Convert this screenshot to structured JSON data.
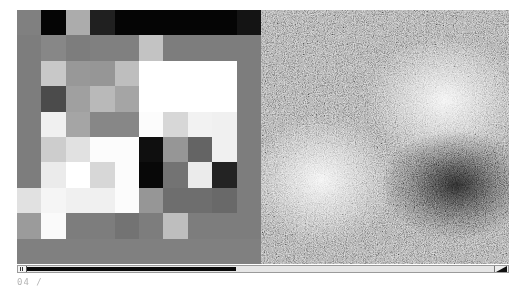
{
  "left_panel": {
    "rows": 10,
    "cols": 10,
    "cells": [
      [
        128,
        5,
        172,
        32,
        5,
        5,
        5,
        5,
        5,
        20
      ],
      [
        125,
        135,
        125,
        128,
        128,
        195,
        125,
        125,
        125,
        125
      ],
      [
        125,
        200,
        152,
        150,
        190,
        255,
        255,
        255,
        255,
        125
      ],
      [
        125,
        75,
        160,
        185,
        165,
        255,
        255,
        255,
        255,
        125
      ],
      [
        125,
        240,
        165,
        135,
        135,
        252,
        215,
        242,
        240,
        125
      ],
      [
        125,
        205,
        225,
        252,
        252,
        15,
        150,
        100,
        240,
        125
      ],
      [
        125,
        235,
        255,
        215,
        252,
        8,
        115,
        235,
        35,
        125
      ],
      [
        225,
        245,
        240,
        240,
        252,
        150,
        110,
        110,
        105,
        125
      ],
      [
        155,
        250,
        125,
        125,
        115,
        125,
        190,
        125,
        125,
        125
      ],
      [
        128,
        128,
        128,
        128,
        128,
        128,
        128,
        128,
        128,
        128
      ]
    ]
  },
  "right_panel": {
    "blobs": [
      {
        "cx": 184,
        "cy": 90,
        "r": 80,
        "tone": "bright"
      },
      {
        "cx": 60,
        "cy": 170,
        "r": 80,
        "tone": "bright"
      },
      {
        "cx": 195,
        "cy": 175,
        "r": 75,
        "tone": "dark"
      }
    ]
  },
  "scrollbar": {
    "thumb_start_px": 9,
    "thumb_end_px": 218,
    "left_button_glyph": "II",
    "right_corner": "resize-triangle"
  },
  "footer": {
    "frame_label": "04 /"
  }
}
